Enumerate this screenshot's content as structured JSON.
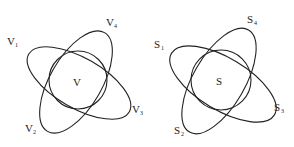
{
  "diagrams": [
    {
      "name": "V",
      "center_label": "V",
      "labels": [
        {
          "base": "V",
          "sub": "1"
        },
        {
          "base": "V",
          "sub": "4"
        },
        {
          "base": "V",
          "sub": "3"
        },
        {
          "base": "V",
          "sub": "2"
        }
      ]
    },
    {
      "name": "S",
      "center_label": "S",
      "labels": [
        {
          "base": "S",
          "sub": "1"
        },
        {
          "base": "S",
          "sub": "4"
        },
        {
          "base": "S",
          "sub": "3"
        },
        {
          "base": "S",
          "sub": "2"
        }
      ]
    }
  ]
}
